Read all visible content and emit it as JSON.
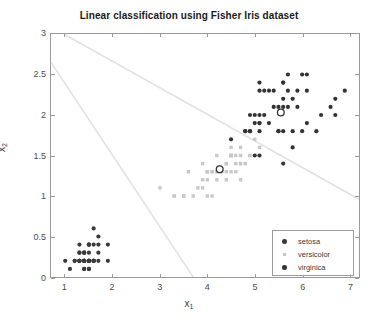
{
  "chart_data": {
    "type": "scatter",
    "title": "Linear classification using Fisher Iris dataset",
    "xlabel": "x_1",
    "xlabel_base": "x",
    "xlabel_sub": "1",
    "ylabel_base": "x",
    "ylabel_sub": "2",
    "xlim": [
      0.7,
      7.2
    ],
    "ylim": [
      0.0,
      3.0
    ],
    "xticks": [
      1,
      2,
      3,
      4,
      5,
      6,
      7
    ],
    "yticks": [
      0,
      0.5,
      1,
      1.5,
      2,
      2.5,
      3
    ],
    "xticklabels": [
      "1",
      "2",
      "3",
      "4",
      "5",
      "6",
      "7"
    ],
    "yticklabels": [
      "0",
      "0.5",
      "1",
      "1.5",
      "2",
      "2.5",
      "3"
    ],
    "grid": false,
    "legend_position": "lower right",
    "colors": {
      "setosa": "#3a3a3a",
      "versicolor": "#c8c8c8",
      "virginica": "#333333",
      "boundary": "#e2e2e2",
      "axis": "#9a9a9a",
      "text": "#3a3a3a",
      "title": "#1a1a1a"
    },
    "series": [
      {
        "name": "setosa",
        "marker": "filled-circle",
        "color": "#3a3a3a",
        "size": 4.2,
        "points": [
          [
            1.4,
            0.2
          ],
          [
            1.4,
            0.2
          ],
          [
            1.3,
            0.2
          ],
          [
            1.5,
            0.2
          ],
          [
            1.4,
            0.2
          ],
          [
            1.7,
            0.4
          ],
          [
            1.4,
            0.3
          ],
          [
            1.5,
            0.2
          ],
          [
            1.4,
            0.2
          ],
          [
            1.5,
            0.1
          ],
          [
            1.5,
            0.2
          ],
          [
            1.6,
            0.2
          ],
          [
            1.4,
            0.1
          ],
          [
            1.1,
            0.1
          ],
          [
            1.2,
            0.2
          ],
          [
            1.5,
            0.4
          ],
          [
            1.3,
            0.4
          ],
          [
            1.4,
            0.3
          ],
          [
            1.7,
            0.3
          ],
          [
            1.5,
            0.3
          ],
          [
            1.7,
            0.2
          ],
          [
            1.5,
            0.4
          ],
          [
            1.0,
            0.2
          ],
          [
            1.7,
            0.5
          ],
          [
            1.9,
            0.2
          ],
          [
            1.6,
            0.2
          ],
          [
            1.6,
            0.4
          ],
          [
            1.5,
            0.2
          ],
          [
            1.4,
            0.2
          ],
          [
            1.6,
            0.2
          ],
          [
            1.6,
            0.2
          ],
          [
            1.5,
            0.4
          ],
          [
            1.5,
            0.1
          ],
          [
            1.4,
            0.2
          ],
          [
            1.5,
            0.2
          ],
          [
            1.2,
            0.2
          ],
          [
            1.3,
            0.2
          ],
          [
            1.4,
            0.1
          ],
          [
            1.3,
            0.2
          ],
          [
            1.5,
            0.2
          ],
          [
            1.3,
            0.3
          ],
          [
            1.3,
            0.3
          ],
          [
            1.3,
            0.2
          ],
          [
            1.6,
            0.6
          ],
          [
            1.9,
            0.4
          ],
          [
            1.4,
            0.3
          ],
          [
            1.6,
            0.2
          ],
          [
            1.4,
            0.2
          ],
          [
            1.5,
            0.2
          ],
          [
            1.4,
            0.2
          ]
        ]
      },
      {
        "name": "versicolor",
        "marker": "filled-square",
        "color": "#c8c8c8",
        "size": 3.4,
        "points": [
          [
            4.7,
            1.4
          ],
          [
            4.5,
            1.5
          ],
          [
            4.9,
            1.5
          ],
          [
            4.0,
            1.3
          ],
          [
            4.6,
            1.5
          ],
          [
            4.5,
            1.3
          ],
          [
            4.7,
            1.6
          ],
          [
            3.3,
            1.0
          ],
          [
            4.6,
            1.3
          ],
          [
            3.9,
            1.4
          ],
          [
            3.5,
            1.0
          ],
          [
            4.2,
            1.5
          ],
          [
            4.0,
            1.0
          ],
          [
            4.7,
            1.4
          ],
          [
            3.6,
            1.3
          ],
          [
            4.4,
            1.4
          ],
          [
            4.5,
            1.5
          ],
          [
            4.1,
            1.0
          ],
          [
            4.5,
            1.5
          ],
          [
            3.9,
            1.1
          ],
          [
            4.8,
            1.8
          ],
          [
            4.0,
            1.3
          ],
          [
            4.9,
            1.5
          ],
          [
            4.7,
            1.2
          ],
          [
            4.3,
            1.3
          ],
          [
            4.4,
            1.4
          ],
          [
            4.8,
            1.4
          ],
          [
            5.0,
            1.7
          ],
          [
            4.5,
            1.5
          ],
          [
            3.5,
            1.0
          ],
          [
            3.8,
            1.1
          ],
          [
            3.7,
            1.0
          ],
          [
            3.9,
            1.2
          ],
          [
            5.1,
            1.6
          ],
          [
            4.5,
            1.5
          ],
          [
            4.5,
            1.6
          ],
          [
            4.7,
            1.5
          ],
          [
            4.4,
            1.3
          ],
          [
            4.1,
            1.3
          ],
          [
            4.0,
            1.3
          ],
          [
            4.4,
            1.2
          ],
          [
            4.6,
            1.4
          ],
          [
            4.0,
            1.2
          ],
          [
            3.3,
            1.0
          ],
          [
            4.2,
            1.3
          ],
          [
            4.2,
            1.2
          ],
          [
            4.2,
            1.3
          ],
          [
            4.3,
            1.3
          ],
          [
            3.0,
            1.1
          ],
          [
            4.1,
            1.3
          ]
        ]
      },
      {
        "name": "virginica",
        "marker": "filled-circle",
        "color": "#333333",
        "size": 4.2,
        "points": [
          [
            6.0,
            2.5
          ],
          [
            5.1,
            1.9
          ],
          [
            5.9,
            2.1
          ],
          [
            5.6,
            1.8
          ],
          [
            5.8,
            2.2
          ],
          [
            6.6,
            2.1
          ],
          [
            4.5,
            1.7
          ],
          [
            6.3,
            1.8
          ],
          [
            5.8,
            1.8
          ],
          [
            6.1,
            2.5
          ],
          [
            5.1,
            2.0
          ],
          [
            5.3,
            1.9
          ],
          [
            5.5,
            2.1
          ],
          [
            5.0,
            2.0
          ],
          [
            5.1,
            2.4
          ],
          [
            5.3,
            2.3
          ],
          [
            5.5,
            1.8
          ],
          [
            6.7,
            2.2
          ],
          [
            6.9,
            2.3
          ],
          [
            5.0,
            1.5
          ],
          [
            5.7,
            2.3
          ],
          [
            4.9,
            2.0
          ],
          [
            6.7,
            2.0
          ],
          [
            4.9,
            1.8
          ],
          [
            5.7,
            2.1
          ],
          [
            6.0,
            1.8
          ],
          [
            4.8,
            1.8
          ],
          [
            4.9,
            1.8
          ],
          [
            5.6,
            2.1
          ],
          [
            5.8,
            1.6
          ],
          [
            6.1,
            1.9
          ],
          [
            6.4,
            2.0
          ],
          [
            5.6,
            2.2
          ],
          [
            5.1,
            1.5
          ],
          [
            5.6,
            1.4
          ],
          [
            6.1,
            2.3
          ],
          [
            5.6,
            2.4
          ],
          [
            5.5,
            1.8
          ],
          [
            4.8,
            1.8
          ],
          [
            5.4,
            2.1
          ],
          [
            5.6,
            2.4
          ],
          [
            5.1,
            2.3
          ],
          [
            5.1,
            1.9
          ],
          [
            5.9,
            2.3
          ],
          [
            5.7,
            2.5
          ],
          [
            5.2,
            2.3
          ],
          [
            5.0,
            1.9
          ],
          [
            5.2,
            2.0
          ],
          [
            5.4,
            2.3
          ],
          [
            5.1,
            1.8
          ]
        ]
      }
    ],
    "centroids": [
      {
        "name": "versicolor-centroid",
        "x": 4.26,
        "y": 1.33,
        "marker": "open-circle",
        "color": "#333333"
      },
      {
        "name": "virginica-centroid",
        "x": 5.55,
        "y": 2.03,
        "marker": "open-circle",
        "color": "#333333"
      }
    ],
    "boundaries": [
      {
        "name": "boundary-line-1",
        "x0": 0.97,
        "y0": 3.0,
        "x1": 7.2,
        "y1": 0.96,
        "color": "#e2e2e2"
      },
      {
        "name": "boundary-line-2",
        "x0": 0.7,
        "y0": 2.65,
        "x1": 3.7,
        "y1": 0.0,
        "color": "#e2e2e2"
      }
    ],
    "legend": [
      {
        "label": "setosa",
        "marker": "filled-circle",
        "color": "#3a3a3a"
      },
      {
        "label": "versicolor",
        "marker": "filled-square",
        "color": "#c8c8c8"
      },
      {
        "label": "virginica",
        "marker": "filled-circle",
        "color": "#333333"
      }
    ]
  }
}
